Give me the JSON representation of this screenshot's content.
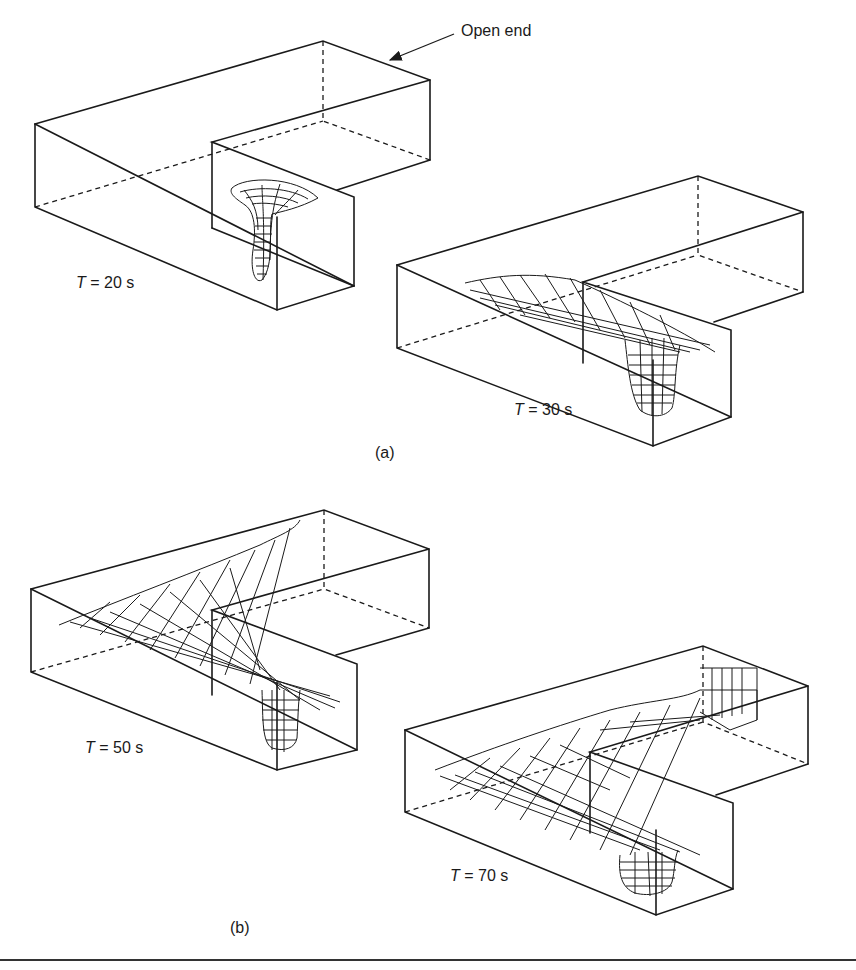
{
  "annotation": {
    "open_end": "Open end"
  },
  "panels": [
    {
      "id": "a1",
      "time_var": "T",
      "time_rest": " = 20 s"
    },
    {
      "id": "a2",
      "time_var": "T",
      "time_rest": " = 30 s"
    },
    {
      "id": "b1",
      "time_var": "T",
      "time_rest": " = 50 s"
    },
    {
      "id": "b2",
      "time_var": "T",
      "time_rest": " = 70 s"
    }
  ],
  "captions": {
    "a": "(a)",
    "b": "(b)"
  },
  "colors": {
    "line": "#1a1a1a",
    "background": "#ffffff"
  }
}
